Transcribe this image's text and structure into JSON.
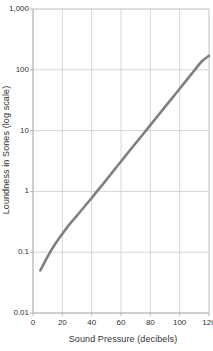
{
  "chart_data": {
    "type": "line",
    "title": "",
    "xlabel": "Sound Pressure (decibels)",
    "ylabel": "Loundness in Sones (log scale)",
    "yscale": "log",
    "xscale": "linear",
    "xlim": [
      0,
      120
    ],
    "ylim": [
      0.01,
      1000
    ],
    "grid": true,
    "legend": "none",
    "line_color": "#808080",
    "grid_color": "#cccccc",
    "axis_color": "#b3b3b3",
    "xticks": [
      "0",
      "20",
      "40",
      "60",
      "80",
      "100",
      "120"
    ],
    "xtick_values": [
      0,
      20,
      40,
      60,
      80,
      100,
      120
    ],
    "yticks": [
      "0.01",
      "0.1",
      "1",
      "10",
      "100",
      "1,000"
    ],
    "ytick_values": [
      0.01,
      0.1,
      1,
      10,
      100,
      1000
    ],
    "series": [
      {
        "name": "Loudness",
        "x": [
          5,
          10,
          15,
          20,
          25,
          30,
          35,
          40,
          45,
          50,
          55,
          60,
          65,
          70,
          75,
          80,
          85,
          90,
          95,
          100,
          105,
          110,
          115,
          120
        ],
        "values": [
          0.05,
          0.085,
          0.135,
          0.2,
          0.29,
          0.4,
          0.56,
          0.78,
          1.1,
          1.55,
          2.2,
          3.1,
          4.4,
          6.2,
          8.7,
          12.3,
          17.4,
          24.5,
          34.6,
          48.8,
          68.9,
          97.2,
          137,
          170
        ]
      }
    ]
  },
  "axis_titles": {
    "x": "Sound Pressure (decibels)",
    "y": "Loundness in Sones (log scale)"
  }
}
